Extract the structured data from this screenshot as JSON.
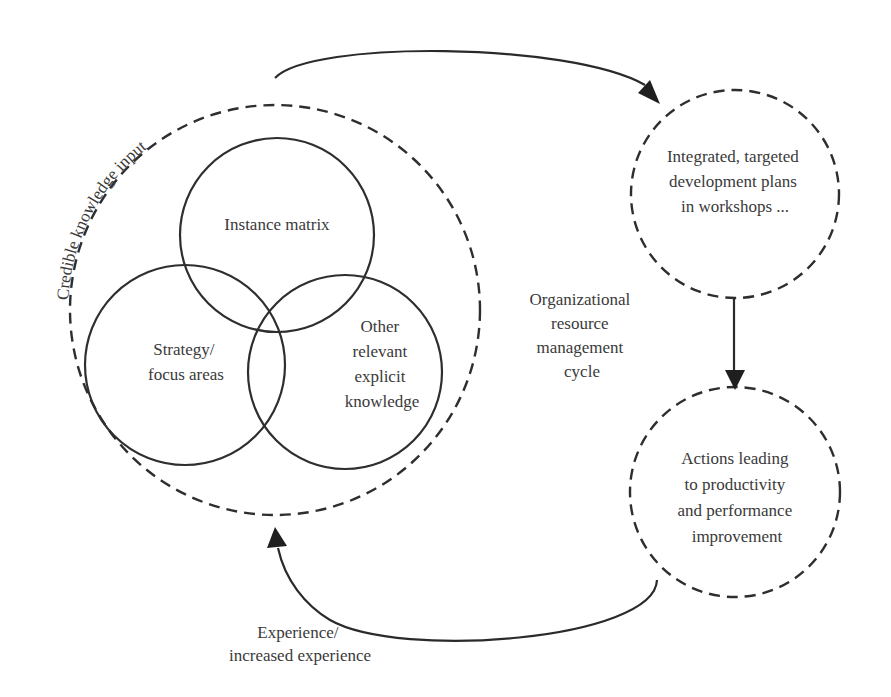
{
  "diagram": {
    "title": "Organizational resource management cycle",
    "outer_cycle": {
      "label": "Credible knowledge input",
      "inner_circles": [
        {
          "label_lines": [
            "Instance matrix"
          ]
        },
        {
          "label_lines": [
            "Strategy/",
            "focus areas"
          ]
        },
        {
          "label_lines": [
            "Other",
            "relevant",
            "explicit",
            "knowledge"
          ]
        }
      ]
    },
    "center_label_lines": [
      "Organizational",
      "resource",
      "management",
      "cycle"
    ],
    "nodes": [
      {
        "label_lines": [
          "Integrated, targeted",
          "development plans",
          "in workshops ..."
        ]
      },
      {
        "label_lines": [
          "Actions leading",
          "to productivity",
          "and performance",
          "improvement"
        ]
      }
    ],
    "feedback_label_lines": [
      "Experience/",
      "increased experience"
    ],
    "colors": {
      "stroke": "#2e2e2e",
      "text": "#3a3a3a",
      "background": "#ffffff"
    }
  }
}
